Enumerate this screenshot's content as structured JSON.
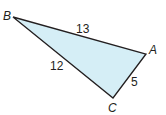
{
  "diagram": {
    "type": "right-triangle",
    "fill_color": "#d5eef6",
    "stroke_color": "#231f20",
    "vertices": [
      {
        "name": "B",
        "x": 13,
        "y": 17,
        "label_x": 3,
        "label_y": 20
      },
      {
        "name": "A",
        "x": 146,
        "y": 54,
        "label_x": 149,
        "label_y": 54
      },
      {
        "name": "C",
        "x": 113,
        "y": 98,
        "label_x": 108,
        "label_y": 112
      }
    ],
    "edges": [
      {
        "from": "B",
        "to": "A",
        "length": "13",
        "label_x": 76,
        "label_y": 33
      },
      {
        "from": "B",
        "to": "C",
        "length": "12",
        "label_x": 50,
        "label_y": 70
      },
      {
        "from": "A",
        "to": "C",
        "length": "5",
        "label_x": 131,
        "label_y": 86
      }
    ]
  }
}
